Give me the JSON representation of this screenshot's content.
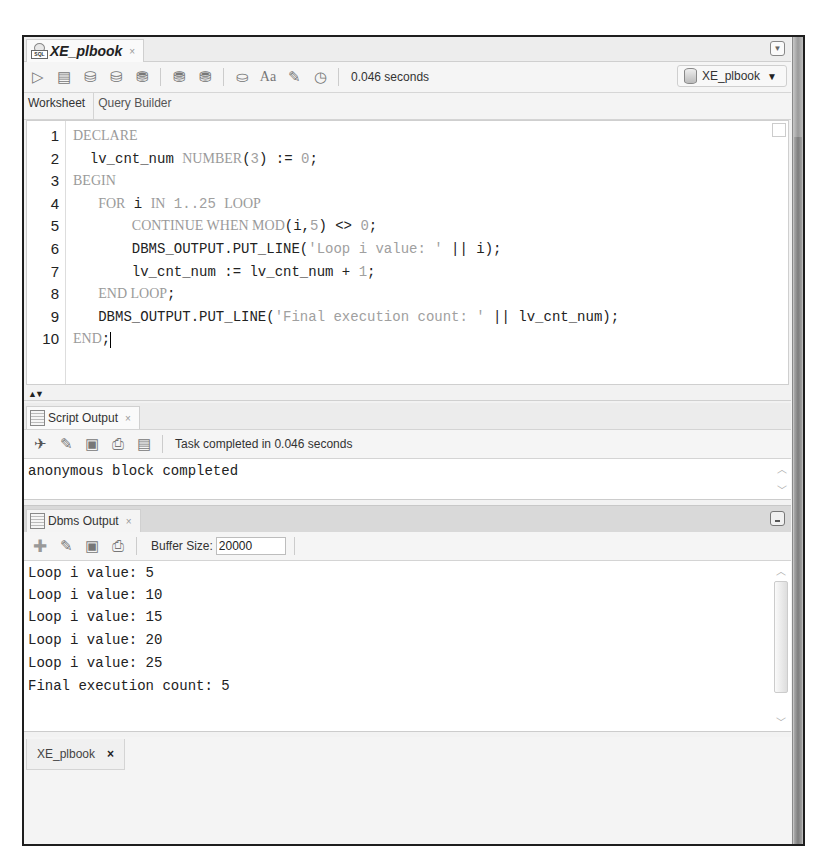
{
  "app": {
    "document_tab": {
      "title": "XE_plbook",
      "close": "×",
      "icon": "sql-worksheet-icon"
    },
    "overflow_menu_icon": "dropdown-arrow-icon"
  },
  "toolbar": {
    "icons": [
      {
        "name": "run-statement-icon",
        "glyph": "▷"
      },
      {
        "name": "run-script-icon",
        "glyph": "▤"
      },
      {
        "name": "commit-icon",
        "glyph": "⛁"
      },
      {
        "name": "rollback-icon",
        "glyph": "⛁"
      },
      {
        "name": "explain-plan-icon",
        "glyph": "⛃"
      },
      {
        "name": "autotrace-icon",
        "glyph": "⛃"
      },
      {
        "name": "sql-tuning-icon",
        "glyph": "⛃"
      },
      {
        "name": "sql-history-icon",
        "glyph": "⛀"
      },
      {
        "name": "format-case-icon",
        "glyph": "Aa"
      },
      {
        "name": "clear-eraser-icon",
        "glyph": "✎"
      },
      {
        "name": "monitor-session-icon",
        "glyph": "◷"
      }
    ],
    "elapsed": "0.046 seconds",
    "connection": {
      "label": "XE_plbook",
      "caret": "▼"
    }
  },
  "subtabs": [
    {
      "label": "Worksheet",
      "active": true
    },
    {
      "label": "Query Builder",
      "active": false
    }
  ],
  "editor": {
    "lines": [
      {
        "num": "1",
        "parts": [
          {
            "t": "DECLARE",
            "k": "kw"
          }
        ],
        "indent": ""
      },
      {
        "num": "2",
        "parts": [
          {
            "t": "lv_cnt_num ",
            "k": ""
          },
          {
            "t": "NUMBER",
            "k": "kw"
          },
          {
            "t": "(",
            "k": ""
          },
          {
            "t": "3",
            "k": "lit"
          },
          {
            "t": ") := ",
            "k": ""
          },
          {
            "t": "0",
            "k": "lit"
          },
          {
            "t": ";",
            "k": ""
          }
        ],
        "indent": "  "
      },
      {
        "num": "3",
        "parts": [
          {
            "t": "BEGIN",
            "k": "kw"
          }
        ],
        "indent": ""
      },
      {
        "num": "4",
        "parts": [
          {
            "t": "FOR",
            "k": "kw"
          },
          {
            "t": " i ",
            "k": ""
          },
          {
            "t": "IN",
            "k": "kw"
          },
          {
            "t": " ",
            "k": ""
          },
          {
            "t": "1..25",
            "k": "lit"
          },
          {
            "t": " ",
            "k": ""
          },
          {
            "t": "LOOP",
            "k": "kw"
          }
        ],
        "indent": "   "
      },
      {
        "num": "5",
        "parts": [
          {
            "t": "CONTINUE WHEN MOD",
            "k": "kw"
          },
          {
            "t": "(i,",
            "k": ""
          },
          {
            "t": "5",
            "k": "lit"
          },
          {
            "t": ") <> ",
            "k": ""
          },
          {
            "t": "0",
            "k": "lit"
          },
          {
            "t": ";",
            "k": ""
          }
        ],
        "indent": "       "
      },
      {
        "num": "6",
        "parts": [
          {
            "t": "DBMS_OUTPUT.PUT_LINE(",
            "k": ""
          },
          {
            "t": "'Loop i value: '",
            "k": "lit"
          },
          {
            "t": " || i);",
            "k": ""
          }
        ],
        "indent": "       "
      },
      {
        "num": "7",
        "parts": [
          {
            "t": "lv_cnt_num := lv_cnt_num + ",
            "k": ""
          },
          {
            "t": "1",
            "k": "lit"
          },
          {
            "t": ";",
            "k": ""
          }
        ],
        "indent": "       "
      },
      {
        "num": "8",
        "parts": [
          {
            "t": "END LOOP",
            "k": "kw"
          },
          {
            "t": ";",
            "k": ""
          }
        ],
        "indent": "   "
      },
      {
        "num": "9",
        "parts": [
          {
            "t": "DBMS_OUTPUT.PUT_LINE(",
            "k": ""
          },
          {
            "t": "'Final execution count: '",
            "k": "lit"
          },
          {
            "t": " || lv_cnt_num);",
            "k": ""
          }
        ],
        "indent": "   "
      },
      {
        "num": "10",
        "parts": [
          {
            "t": "END",
            "k": "kw"
          },
          {
            "t": ";",
            "k": ""
          }
        ],
        "indent": "",
        "cursor": true
      }
    ],
    "splitter_arrows": "▲▼"
  },
  "script_output": {
    "tab_label": "Script Output",
    "close": "×",
    "icons": [
      {
        "name": "pin-icon",
        "glyph": "📌"
      },
      {
        "name": "clear-eraser-icon",
        "glyph": "✎"
      },
      {
        "name": "save-icon",
        "glyph": "🖫"
      },
      {
        "name": "print-icon",
        "glyph": "🖶"
      },
      {
        "name": "run-script-icon",
        "glyph": "▤"
      }
    ],
    "status": "Task completed in 0.046 seconds",
    "lines": [
      "anonymous block completed"
    ]
  },
  "dbms_output": {
    "tab_label": "Dbms Output",
    "close": "×",
    "icons": [
      {
        "name": "enable-add-icon",
        "glyph": "✚"
      },
      {
        "name": "clear-eraser-icon",
        "glyph": "✎"
      },
      {
        "name": "save-icon",
        "glyph": "🖫"
      },
      {
        "name": "print-icon",
        "glyph": "🖶"
      }
    ],
    "buffer_label": "Buffer Size:",
    "buffer_value": "20000",
    "lines": [
      "Loop i value: 5",
      "Loop i value: 10",
      "Loop i value: 15",
      "Loop i value: 20",
      "Loop i value: 25",
      "Final execution count: 5"
    ]
  },
  "bottom_tab": {
    "label": "XE_plbook",
    "close": "×"
  },
  "scroll": {
    "up": "^",
    "down": "v"
  }
}
